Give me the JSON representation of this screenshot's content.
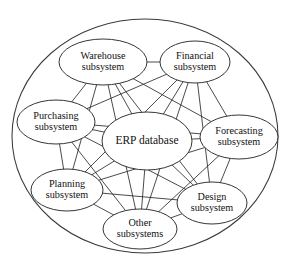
{
  "diagram": {
    "type": "hub-and-spoke network",
    "boundary": {
      "name": "enterprise-boundary",
      "shape": "ellipse",
      "cx": 145,
      "cy": 136,
      "rx": 133,
      "ry": 117,
      "stroke": "#3a3a3a"
    },
    "style": {
      "node_fill": "#ffffff",
      "node_stroke": "#2b2b2b",
      "edge_stroke": "#2b2b2b",
      "text_color": "#111111",
      "background": "#ffffff"
    },
    "nodes": [
      {
        "id": "erp",
        "label_line1": "ERP database",
        "label_line2": "",
        "cx": 147,
        "cy": 141,
        "rx": 45,
        "ry": 29,
        "font_size": 11.5,
        "role": "central-hub"
      },
      {
        "id": "warehouse",
        "label_line1": "Warehouse",
        "label_line2": "subsystem",
        "cx": 103,
        "cy": 62,
        "rx": 44,
        "ry": 23,
        "font_size": 10.2,
        "role": "subsystem"
      },
      {
        "id": "financial",
        "label_line1": "Financial",
        "label_line2": "subsystem",
        "cx": 195,
        "cy": 62,
        "rx": 35,
        "ry": 21,
        "font_size": 10.2,
        "role": "subsystem"
      },
      {
        "id": "purchasing",
        "label_line1": "Purchasing",
        "label_line2": "subsystem",
        "cx": 56,
        "cy": 122,
        "rx": 39,
        "ry": 22,
        "font_size": 10.2,
        "role": "subsystem"
      },
      {
        "id": "forecasting",
        "label_line1": "Forecasting",
        "label_line2": "subsystem",
        "cx": 239,
        "cy": 137,
        "rx": 39,
        "ry": 22,
        "font_size": 10.2,
        "role": "subsystem"
      },
      {
        "id": "planning",
        "label_line1": "Planning",
        "label_line2": "subsystem",
        "cx": 67,
        "cy": 190,
        "rx": 36,
        "ry": 21,
        "font_size": 10.2,
        "role": "subsystem"
      },
      {
        "id": "design",
        "label_line1": "Design",
        "label_line2": "subsystem",
        "cx": 212,
        "cy": 203,
        "rx": 35,
        "ry": 21,
        "font_size": 10.2,
        "role": "subsystem"
      },
      {
        "id": "other",
        "label_line1": "Other",
        "label_line2": "subsystems",
        "cx": 140,
        "cy": 229,
        "rx": 37,
        "ry": 20,
        "font_size": 10.2,
        "role": "subsystem"
      }
    ],
    "edges": [
      {
        "from": "erp",
        "to": "warehouse"
      },
      {
        "from": "erp",
        "to": "financial"
      },
      {
        "from": "erp",
        "to": "purchasing"
      },
      {
        "from": "erp",
        "to": "forecasting"
      },
      {
        "from": "erp",
        "to": "planning"
      },
      {
        "from": "erp",
        "to": "design"
      },
      {
        "from": "erp",
        "to": "other"
      },
      {
        "from": "warehouse",
        "to": "financial"
      },
      {
        "from": "warehouse",
        "to": "purchasing"
      },
      {
        "from": "warehouse",
        "to": "forecasting"
      },
      {
        "from": "warehouse",
        "to": "planning"
      },
      {
        "from": "warehouse",
        "to": "design"
      },
      {
        "from": "warehouse",
        "to": "other"
      },
      {
        "from": "financial",
        "to": "purchasing"
      },
      {
        "from": "financial",
        "to": "forecasting"
      },
      {
        "from": "financial",
        "to": "planning"
      },
      {
        "from": "financial",
        "to": "design"
      },
      {
        "from": "financial",
        "to": "other"
      },
      {
        "from": "purchasing",
        "to": "forecasting"
      },
      {
        "from": "purchasing",
        "to": "planning"
      },
      {
        "from": "purchasing",
        "to": "design"
      },
      {
        "from": "purchasing",
        "to": "other"
      },
      {
        "from": "forecasting",
        "to": "planning"
      },
      {
        "from": "forecasting",
        "to": "design"
      },
      {
        "from": "forecasting",
        "to": "other"
      },
      {
        "from": "planning",
        "to": "design"
      },
      {
        "from": "planning",
        "to": "other"
      },
      {
        "from": "design",
        "to": "other"
      }
    ]
  }
}
